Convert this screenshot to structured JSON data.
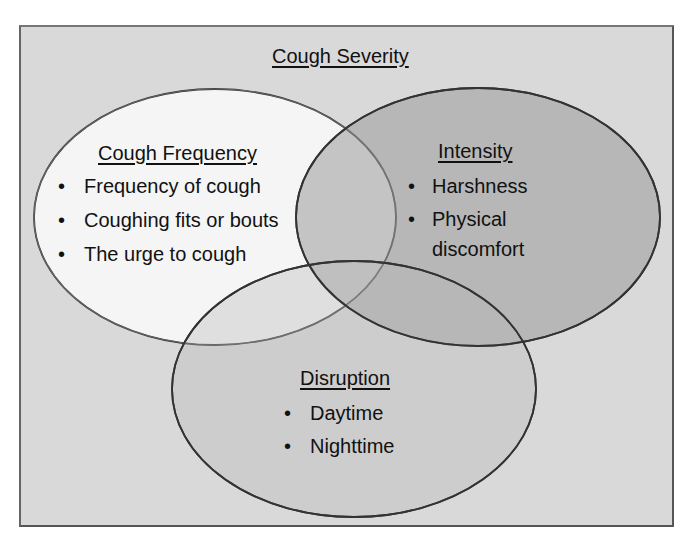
{
  "title": "Cough Severity",
  "circles": [
    {
      "id": "frequency",
      "heading": "Cough Frequency",
      "items": [
        "Frequency of cough",
        "Coughing fits or bouts",
        "The urge to cough"
      ],
      "fill": "#f5f5f5"
    },
    {
      "id": "intensity",
      "heading": "Intensity",
      "items": [
        "Harshness",
        "Physical",
        "discomfort"
      ],
      "fill": "#bdbdbd"
    },
    {
      "id": "disruption",
      "heading": "Disruption",
      "items": [
        "Daytime",
        "Nighttime"
      ],
      "fill": "#cfcfcf"
    }
  ],
  "bullet_glyph": "•",
  "colors": {
    "frame_bg": "#d9d9d9",
    "frame_border": "#555555",
    "outline": "#333333",
    "text": "#111111"
  }
}
